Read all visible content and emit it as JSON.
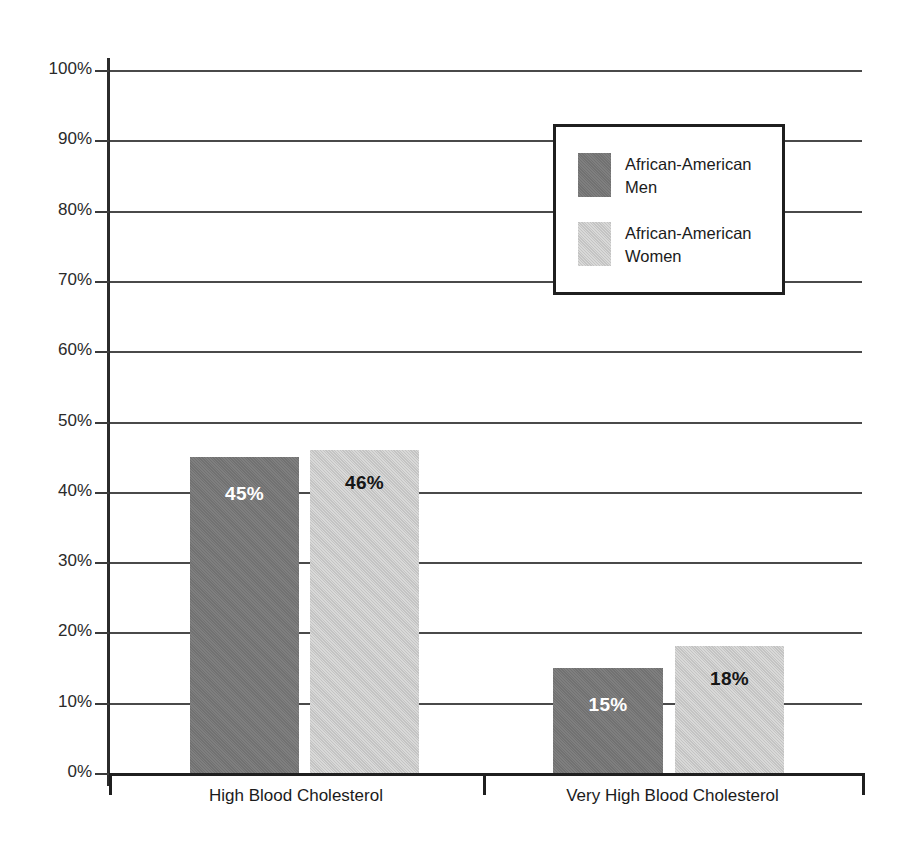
{
  "chart_data": {
    "type": "bar",
    "title": "",
    "subtitle": "",
    "xlabel": "",
    "ylabel": "",
    "ylim": [
      0,
      100
    ],
    "grid": true,
    "legend_position": "top-right",
    "categories": [
      "High Blood Cholesterol",
      "Very High Blood Cholesterol"
    ],
    "series": [
      {
        "name": "African-American Men",
        "color": "#787878",
        "values": [
          45,
          15
        ],
        "value_labels": [
          "45%",
          "15%"
        ],
        "label_color": "#ffffff"
      },
      {
        "name": "African-American Women",
        "color": "#cececd",
        "values": [
          46,
          18
        ],
        "value_labels": [
          "46%",
          "18%"
        ],
        "label_color": "#161616"
      }
    ],
    "y_ticks": [
      {
        "value": 100,
        "label": "100%"
      },
      {
        "value": 90,
        "label": "90%"
      },
      {
        "value": 80,
        "label": "80%"
      },
      {
        "value": 70,
        "label": "70%"
      },
      {
        "value": 60,
        "label": "60%"
      },
      {
        "value": 50,
        "label": "50%"
      },
      {
        "value": 40,
        "label": "40%"
      },
      {
        "value": 30,
        "label": "30%"
      },
      {
        "value": 20,
        "label": "20%"
      },
      {
        "value": 10,
        "label": "10%"
      },
      {
        "value": 0,
        "label": "0%"
      }
    ]
  },
  "legend": {
    "items": [
      {
        "label": "African-American Men"
      },
      {
        "label": "African-American Women"
      }
    ]
  },
  "axis": {
    "y_tick_labels": [
      "100%",
      "90%",
      "80%",
      "70%",
      "60%",
      "50%",
      "40%",
      "30%",
      "20%",
      "10%",
      "0%"
    ],
    "x_tick_labels": [
      "High Blood Cholesterol",
      "Very High Blood Cholesterol"
    ]
  },
  "colors": {
    "series_dark": "#787878",
    "series_light": "#cececd",
    "gridline": "#4a4a4a",
    "axis": "#1f1f1f",
    "text": "#1b1b1b"
  }
}
